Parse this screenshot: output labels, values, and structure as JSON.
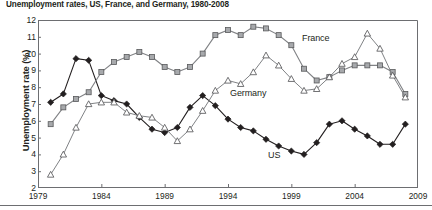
{
  "title": "Unemployment rates, US, France, and Germany, 1980-2008",
  "axis": {
    "ylabel": "Unemployment rate (%)",
    "yticks": [
      12,
      11,
      10,
      9,
      8,
      7,
      6,
      5,
      4,
      3,
      2
    ],
    "xticks": [
      1979,
      1984,
      1989,
      1994,
      1999,
      2004,
      2009
    ]
  },
  "series_labels": {
    "france": "France",
    "germany": "Germany",
    "us": "US"
  },
  "colors": {
    "us": "#231f20",
    "france": "#808285",
    "germany": "#6d6e71",
    "axis": "#6d6e71",
    "text": "#231f20"
  },
  "chart_data": {
    "type": "line",
    "title": "Unemployment rates, US, France, and Germany, 1980-2008",
    "xlabel": "",
    "ylabel": "Unemployment rate (%)",
    "xlim": [
      1979,
      2009
    ],
    "ylim": [
      2,
      12
    ],
    "grid": false,
    "legend": "inline-labels",
    "x": [
      1980,
      1981,
      1982,
      1983,
      1984,
      1985,
      1986,
      1987,
      1988,
      1989,
      1990,
      1991,
      1992,
      1993,
      1994,
      1995,
      1996,
      1997,
      1998,
      1999,
      2000,
      2001,
      2002,
      2003,
      2004,
      2005,
      2006,
      2007,
      2008
    ],
    "series": [
      {
        "name": "US",
        "marker": "filled-diamond",
        "values": [
          7.1,
          7.6,
          9.7,
          9.6,
          7.5,
          7.2,
          7.0,
          6.2,
          5.5,
          5.3,
          5.6,
          6.8,
          7.5,
          6.9,
          6.1,
          5.6,
          5.4,
          4.9,
          4.5,
          4.2,
          4.0,
          4.7,
          5.8,
          6.0,
          5.5,
          5.1,
          4.6,
          4.6,
          5.8
        ]
      },
      {
        "name": "France",
        "marker": "filled-square",
        "values": [
          5.8,
          6.8,
          7.3,
          7.7,
          8.9,
          9.5,
          9.8,
          10.1,
          9.8,
          9.2,
          8.9,
          9.2,
          10.0,
          11.1,
          11.4,
          11.1,
          11.6,
          11.5,
          11.1,
          10.5,
          9.1,
          8.4,
          8.6,
          9.0,
          9.3,
          9.3,
          9.3,
          8.9,
          7.6
        ]
      },
      {
        "name": "Germany",
        "marker": "open-triangle",
        "values": [
          2.8,
          4.0,
          5.6,
          7.0,
          7.1,
          7.1,
          6.5,
          6.3,
          6.2,
          5.6,
          4.8,
          5.5,
          6.6,
          7.8,
          8.4,
          8.2,
          8.9,
          9.9,
          9.3,
          8.5,
          7.8,
          7.9,
          8.6,
          9.4,
          9.8,
          11.2,
          10.3,
          8.7,
          7.4
        ]
      }
    ]
  }
}
